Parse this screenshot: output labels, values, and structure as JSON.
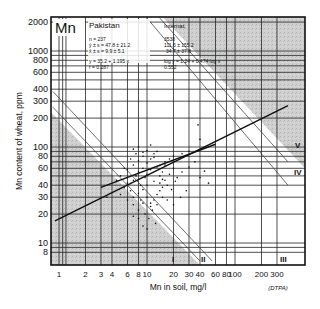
{
  "chart_data": {
    "type": "scatter",
    "element": "Mn",
    "title": "Pakistan",
    "xlabel": "Mn in soil, mg/l",
    "ylabel": "Mn content of wheat, ppm",
    "extraction_note": "(DTPA)",
    "x_scale": "log",
    "y_scale": "log",
    "xlim": [
      0.85,
      400
    ],
    "ylim": [
      6,
      2200
    ],
    "x_ticks": [
      1,
      2,
      3,
      4,
      6,
      8,
      10,
      20,
      30,
      40,
      60,
      80,
      100,
      200,
      300
    ],
    "x_tick_labels": [
      "1",
      "2",
      "3",
      "4",
      "6",
      "8",
      "10",
      "20",
      "30",
      "40",
      "60",
      "80",
      "100",
      "200",
      "300"
    ],
    "y_ticks": [
      8,
      10,
      20,
      30,
      40,
      60,
      80,
      100,
      200,
      300,
      400,
      600,
      800,
      1000,
      2000
    ],
    "y_tick_labels": [
      "8",
      "10",
      "20",
      "30",
      "40",
      "60",
      "80",
      "100",
      "200",
      "300",
      "400",
      "600",
      "800",
      "1000",
      "2000"
    ],
    "grid": true,
    "stats_country": {
      "label": "Pakistan",
      "n": "n = 237",
      "y_mean_sd": "ȳ ± s = 47.8 ± 21.2",
      "x_mean_sd": "x̄ ± s = 9.9 ± 5.1",
      "regression": "y = 35.2 + 1.195 x",
      "r": "r = 0.287"
    },
    "stats_international": {
      "label": "Internat.",
      "n": "3538",
      "y_mean_sd": "111.6 ± 155.2",
      "x_mean_sd": "34.7 ± 37.8",
      "regression": "log y = 1.24 + 0.474 log x",
      "r": "0.552"
    },
    "zones": [
      "I",
      "II",
      "III",
      "IV",
      "V"
    ],
    "regression_lines": [
      {
        "name": "International",
        "x": [
          0.9,
          400
        ],
        "y": [
          17,
          270
        ]
      },
      {
        "name": "Pakistan",
        "x": [
          3,
          60
        ],
        "y": [
          38,
          107
        ]
      }
    ],
    "points": [
      [
        5.5,
        38
      ],
      [
        6,
        42
      ],
      [
        7,
        45
      ],
      [
        7.5,
        50
      ],
      [
        8,
        55
      ],
      [
        8.5,
        40
      ],
      [
        9,
        60
      ],
      [
        9.5,
        48
      ],
      [
        10,
        52
      ],
      [
        11,
        58
      ],
      [
        6.5,
        35
      ],
      [
        7,
        30
      ],
      [
        8,
        33
      ],
      [
        9,
        36
      ],
      [
        10,
        40
      ],
      [
        12,
        44
      ],
      [
        13,
        62
      ],
      [
        14,
        50
      ],
      [
        15,
        55
      ],
      [
        16,
        70
      ],
      [
        5,
        50
      ],
      [
        6,
        58
      ],
      [
        7,
        65
      ],
      [
        8,
        72
      ],
      [
        9,
        80
      ],
      [
        10,
        68
      ],
      [
        11,
        75
      ],
      [
        12,
        85
      ],
      [
        13,
        90
      ],
      [
        14,
        64
      ],
      [
        6,
        28
      ],
      [
        7,
        25
      ],
      [
        8,
        22
      ],
      [
        9,
        26
      ],
      [
        10,
        30
      ],
      [
        11,
        24
      ],
      [
        12,
        28
      ],
      [
        13,
        32
      ],
      [
        14,
        35
      ],
      [
        15,
        38
      ],
      [
        7,
        95
      ],
      [
        8,
        100
      ],
      [
        9,
        88
      ],
      [
        10,
        92
      ],
      [
        11,
        105
      ],
      [
        12,
        78
      ],
      [
        16,
        45
      ],
      [
        18,
        52
      ],
      [
        20,
        60
      ],
      [
        22,
        48
      ],
      [
        4.5,
        45
      ],
      [
        5,
        32
      ],
      [
        5.5,
        60
      ],
      [
        6.5,
        75
      ],
      [
        7.5,
        85
      ],
      [
        8.5,
        28
      ],
      [
        9.5,
        20
      ],
      [
        10.5,
        18
      ],
      [
        11.5,
        22
      ],
      [
        12.5,
        16
      ],
      [
        14,
        42
      ],
      [
        15,
        46
      ],
      [
        17,
        40
      ],
      [
        19,
        36
      ],
      [
        21,
        44
      ],
      [
        25,
        55
      ],
      [
        30,
        62
      ],
      [
        35,
        70
      ],
      [
        40,
        48
      ],
      [
        28,
        35
      ],
      [
        9,
        15
      ],
      [
        10,
        14
      ],
      [
        8,
        18
      ],
      [
        7,
        19
      ],
      [
        11,
        26
      ],
      [
        13,
        25
      ],
      [
        15,
        30
      ],
      [
        17,
        28
      ],
      [
        20,
        25
      ],
      [
        24,
        30
      ],
      [
        38,
        170
      ],
      [
        40,
        120
      ],
      [
        30,
        90
      ],
      [
        25,
        85
      ],
      [
        20,
        80
      ],
      [
        18,
        75
      ],
      [
        16,
        65
      ],
      [
        45,
        56
      ],
      [
        50,
        42
      ],
      [
        3.5,
        30
      ]
    ]
  }
}
